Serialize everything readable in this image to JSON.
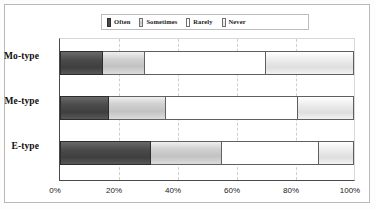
{
  "chart_data": {
    "type": "bar",
    "orientation": "horizontal",
    "stacked": true,
    "normalized": true,
    "title": "",
    "xlabel": "",
    "ylabel": "",
    "xlim": [
      0,
      100
    ],
    "xticks": [
      "0%",
      "20%",
      "40%",
      "60%",
      "80%",
      "100%"
    ],
    "xtick_values": [
      0,
      20,
      40,
      60,
      80,
      100
    ],
    "grid": true,
    "legend_position": "top",
    "categories": [
      "Mo-type",
      "Me-type",
      "E-type"
    ],
    "series": [
      {
        "name": "Often",
        "color": "#4b4b4b",
        "values": [
          14.5,
          16.5,
          31
        ]
      },
      {
        "name": "Sometimes",
        "color": "#c8c8c8",
        "values": [
          14.5,
          19.5,
          24
        ]
      },
      {
        "name": "Rarely",
        "color": "#ffffff",
        "values": [
          41,
          45,
          33
        ]
      },
      {
        "name": "Never",
        "color": "#e8e8e8",
        "values": [
          30,
          19,
          12
        ]
      }
    ]
  },
  "legend": {
    "items": [
      {
        "label": "Often",
        "swatch": "often-swatch"
      },
      {
        "label": "Sometimes",
        "swatch": "sometimes-swatch"
      },
      {
        "label": "Rarely",
        "swatch": "rarely-swatch"
      },
      {
        "label": "Never",
        "swatch": "never-swatch"
      }
    ]
  },
  "axis": {
    "ticks": [
      "0%",
      "20%",
      "40%",
      "60%",
      "80%",
      "100%"
    ]
  },
  "categories": [
    "Mo-type",
    "Me-type",
    "E-type"
  ]
}
